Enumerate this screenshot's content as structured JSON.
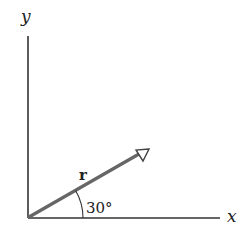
{
  "diagram": {
    "axes": {
      "x_label": "x",
      "y_label": "y"
    },
    "vector": {
      "label": "r",
      "angle_label": "30°",
      "angle_degrees": 30
    },
    "colors": {
      "axis": "#333333",
      "vector": "#666666",
      "text": "#222222"
    }
  }
}
